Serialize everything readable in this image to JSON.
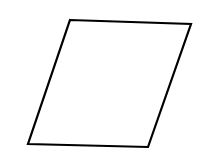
{
  "diagram": {
    "canvas": {
      "width": 197,
      "height": 157,
      "background": "#ffffff"
    },
    "shapes": [
      {
        "type": "parallelogram",
        "points": [
          [
            70,
            20
          ],
          [
            191,
            24
          ],
          [
            148,
            147
          ],
          [
            28,
            144
          ]
        ],
        "stroke": "#000000",
        "stroke_width": 2.2,
        "fill": "#ffffff"
      }
    ],
    "labels": []
  }
}
